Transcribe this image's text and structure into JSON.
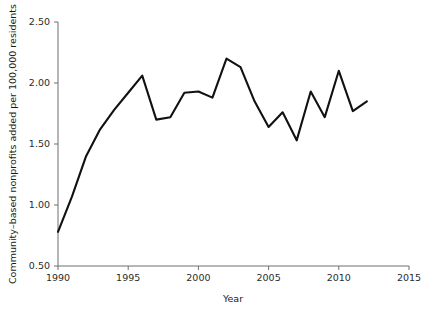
{
  "chart_data": {
    "type": "line",
    "title": "",
    "xlabel": "Year",
    "ylabel": "Community–based nonprofits added per 100,000 residents",
    "xlim": [
      1990,
      2015
    ],
    "ylim": [
      0.5,
      2.5
    ],
    "xticks": [
      1990,
      1995,
      2000,
      2005,
      2010,
      2015
    ],
    "xtick_labels": [
      "1990",
      "1995",
      "2000",
      "2005",
      "2010",
      "2015"
    ],
    "yticks": [
      0.5,
      1.0,
      1.5,
      2.0,
      2.5
    ],
    "ytick_labels": [
      "0.50",
      "1.00",
      "1.50",
      "2.00",
      "2.50"
    ],
    "grid": false,
    "legend": false,
    "legend_position": "none",
    "line_color": "#111111",
    "x": [
      1990,
      1991,
      1992,
      1993,
      1994,
      1995,
      1996,
      1997,
      1998,
      1999,
      2000,
      2001,
      2002,
      2003,
      2004,
      2005,
      2006,
      2007,
      2008,
      2009,
      2010,
      2011,
      2012
    ],
    "values": [
      0.78,
      1.07,
      1.4,
      1.62,
      1.78,
      1.92,
      2.06,
      1.7,
      1.72,
      1.92,
      1.93,
      1.88,
      2.2,
      2.13,
      1.85,
      1.64,
      1.76,
      1.53,
      1.93,
      1.72,
      2.1,
      1.77,
      1.85
    ],
    "series": [
      {
        "name": "Community-based nonprofits added per 100,000 residents",
        "values": [
          0.78,
          1.07,
          1.4,
          1.62,
          1.78,
          1.92,
          2.06,
          1.7,
          1.72,
          1.92,
          1.93,
          1.88,
          2.2,
          2.13,
          1.85,
          1.64,
          1.76,
          1.53,
          1.93,
          1.72,
          2.1,
          1.77,
          1.85
        ]
      }
    ]
  }
}
